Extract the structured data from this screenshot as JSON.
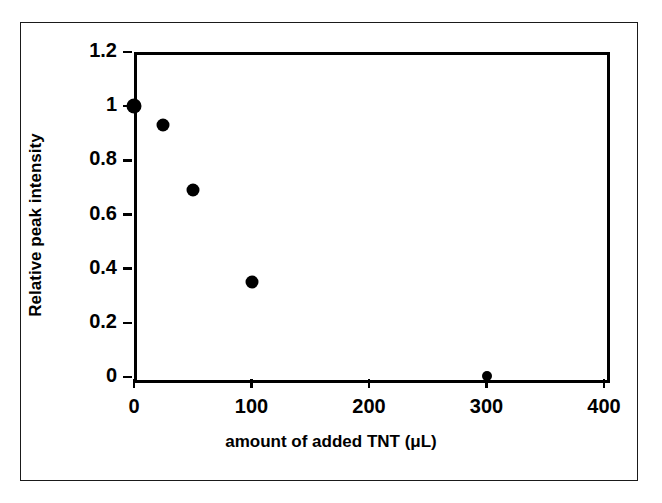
{
  "chart_data": {
    "type": "scatter",
    "title": "",
    "xlabel": "amount of added TNT (μL)",
    "ylabel": "Relative peak intensity",
    "xlim": [
      0,
      400
    ],
    "ylim": [
      0,
      1.2
    ],
    "xticks": [
      0,
      100,
      200,
      300,
      400
    ],
    "xtick_labels": [
      "0",
      "100",
      "200",
      "300",
      "400"
    ],
    "yticks": [
      0,
      0.2,
      0.4,
      0.6,
      0.8,
      1,
      1.2
    ],
    "ytick_labels": [
      "0",
      "0.2",
      "0.4",
      "0.6",
      "0.8",
      "1",
      "1.2"
    ],
    "grid": false,
    "legend": false,
    "legend_position": "none",
    "marker": "circle",
    "marker_color": "#000000",
    "series": [
      {
        "name": "Relative peak intensity",
        "x": [
          0,
          25,
          50,
          100,
          300
        ],
        "y": [
          1.0,
          0.93,
          0.69,
          0.35,
          0.005
        ]
      }
    ],
    "points": [
      {
        "x": 0,
        "y": 1.0,
        "label": "(0, 1.00)"
      },
      {
        "x": 25,
        "y": 0.93,
        "label": "(25, 0.93)"
      },
      {
        "x": 50,
        "y": 0.69,
        "label": "(50, 0.69)"
      },
      {
        "x": 100,
        "y": 0.35,
        "label": "(100, 0.35)"
      },
      {
        "x": 300,
        "y": 0.005,
        "label": "(300, 0.00)"
      }
    ]
  },
  "figure": {
    "background_color": "#ffffff",
    "frame_color": "#000000",
    "axis_color": "#000000"
  }
}
